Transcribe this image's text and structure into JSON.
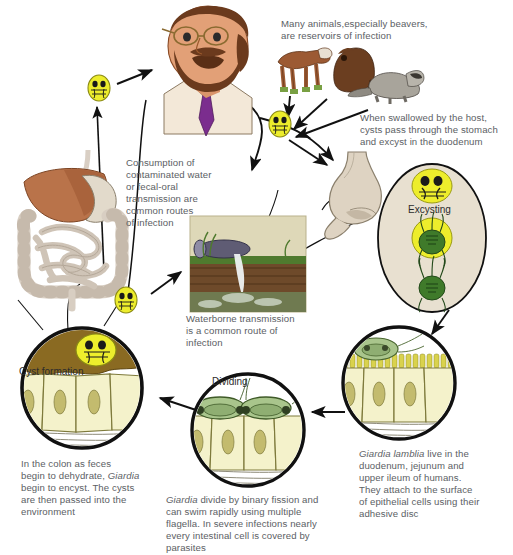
{
  "diagram": {
    "background": "#ffffff",
    "text_color": "#5b6064",
    "accent_cyst": "#eded2c",
    "accent_troph": "#4f7f2a"
  },
  "captions": [
    {
      "id": "animals",
      "lines": [
        "Many animals,especially beavers,",
        "are reservoirs of infection"
      ],
      "x": 281,
      "y": 18
    },
    {
      "id": "swallowed",
      "lines": [
        "When swallowed by the host,",
        "cysts pass through the stomach",
        "and excyst in the duodenum"
      ],
      "x": 360,
      "y": 112
    },
    {
      "id": "consumption",
      "lines": [
        "Consumption of",
        "contaminated water",
        "or fecal-oral",
        "transmission are",
        "common routes",
        "of infection"
      ],
      "x": 126,
      "y": 157
    },
    {
      "id": "waterborne",
      "lines": [
        "Waterborne transmission",
        "is a common route of",
        "infection"
      ],
      "x": 186,
      "y": 313
    },
    {
      "id": "colon",
      "lines": [
        "In the colon as feces",
        "begin to dehydrate, {i}Giardia{/i}",
        "begin to encyst. The cysts",
        "are then passed into the",
        "environment"
      ],
      "x": 21,
      "y": 458
    },
    {
      "id": "dividing-text",
      "lines": [
        "{i}Giardia{/i} divide by binary fission and",
        "can swim rapidly using multiple",
        "flagella. In severe infections nearly",
        "every intestinal  cell is covered by",
        "parasites"
      ],
      "x": 166,
      "y": 494
    },
    {
      "id": "duodenum-text",
      "lines": [
        "{i}Giardia lamblia{/i} live in the",
        "duodenum, jejunum and",
        "upper ileum of humans.",
        "They attach to the surface",
        "of epithelial cells using their",
        "adhesive disc"
      ],
      "x": 359,
      "y": 448
    }
  ],
  "labels": [
    {
      "id": "excysting",
      "text": "Excysting",
      "x": 408,
      "y": 204
    },
    {
      "id": "cyst-formation",
      "text": "Cyst formation",
      "x": 19,
      "y": 366
    },
    {
      "id": "dividing",
      "text": "Dividing",
      "x": 212,
      "y": 376
    }
  ],
  "illustrations": [
    {
      "id": "human-host",
      "name": "man-head-and-shoulders"
    },
    {
      "id": "digestive-system",
      "name": "liver-stomach-intestine"
    },
    {
      "id": "animals",
      "name": "cow-beaver-raccoon"
    },
    {
      "id": "stomach",
      "name": "stomach-duodenum"
    },
    {
      "id": "waterpipe",
      "name": "pipe-discharging-into-stream"
    },
    {
      "id": "excysting-oval",
      "name": "excysting-sequence-oval"
    },
    {
      "id": "circle-duodenum",
      "name": "epithelium-trophozoite-circle"
    },
    {
      "id": "circle-dividing",
      "name": "epithelium-dividing-circle"
    },
    {
      "id": "circle-cyst",
      "name": "colon-cyst-formation-circle"
    }
  ],
  "cysts": [
    {
      "id": "cyst-to-man",
      "x": 98,
      "y": 88
    },
    {
      "id": "cyst-from-animals",
      "x": 279,
      "y": 124
    },
    {
      "id": "cyst-from-gut",
      "x": 125,
      "y": 300
    }
  ]
}
